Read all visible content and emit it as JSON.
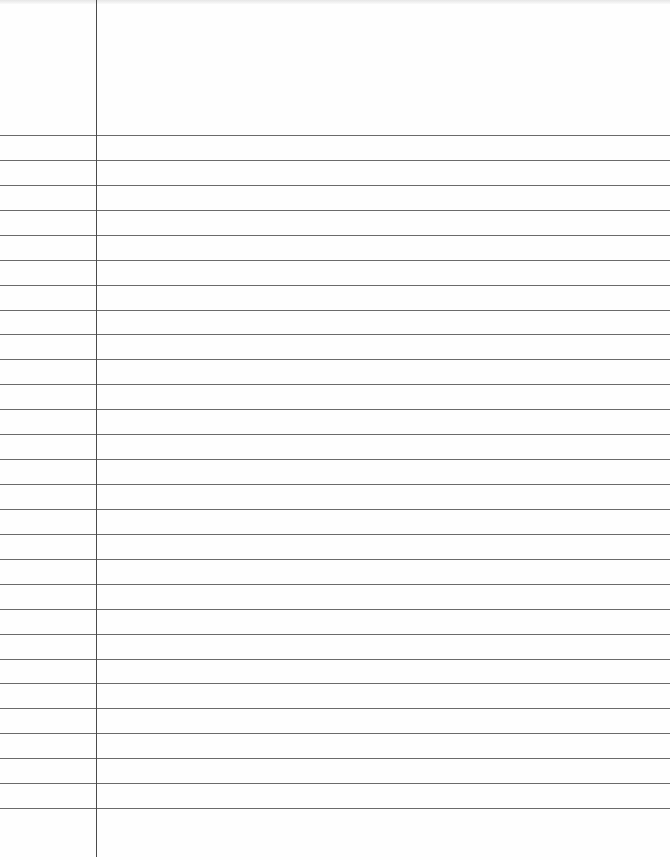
{
  "paper": {
    "type": "lined-notebook-page",
    "width": 670,
    "height": 860,
    "margin_line_x": 96,
    "margin_line_end_y": 857,
    "first_rule_y": 135,
    "rule_spacing": 24.93,
    "rule_count": 28,
    "colors": {
      "background": "#fefefe",
      "rule": "#6a6a6a",
      "margin_line": "#4a4a4a"
    }
  }
}
